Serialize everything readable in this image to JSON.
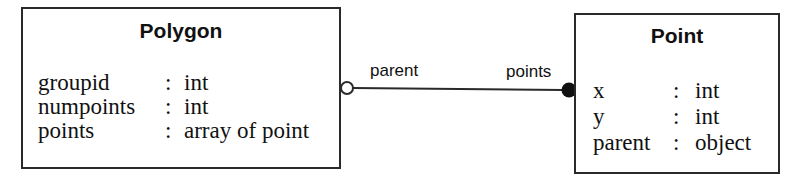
{
  "diagram": {
    "type": "class-diagram",
    "classes": [
      {
        "name": "Polygon",
        "attributes": [
          {
            "name": "groupid",
            "sep": ":",
            "type": "int"
          },
          {
            "name": "numpoints",
            "sep": ":",
            "type": "int"
          },
          {
            "name": "points",
            "sep": ":",
            "type": "array of point"
          }
        ]
      },
      {
        "name": "Point",
        "attributes": [
          {
            "name": "x",
            "sep": ":",
            "type": "int"
          },
          {
            "name": "y",
            "sep": ":",
            "type": "int"
          },
          {
            "name": "parent",
            "sep": ":",
            "type": "object"
          }
        ]
      }
    ],
    "association": {
      "from": "Polygon",
      "to": "Point",
      "from_end": {
        "role": "parent",
        "marker": "open-circle"
      },
      "to_end": {
        "role": "points",
        "marker": "filled-circle"
      }
    },
    "colors": {
      "line": "#2a2a2a",
      "text": "#111111",
      "background": "#ffffff"
    }
  }
}
